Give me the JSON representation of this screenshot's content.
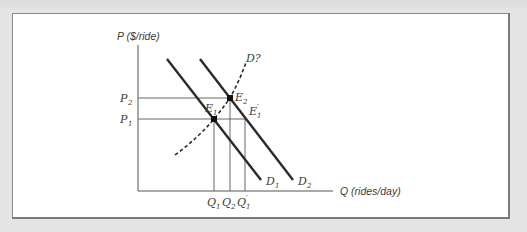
{
  "figure": {
    "y_axis_label": "P ($/ride)",
    "x_axis_label": "Q (rides/day)",
    "price_labels": {
      "p2": "P",
      "p2_sub": "2",
      "p1": "P",
      "p1_sub": "1"
    },
    "quantity_labels": {
      "q1": "Q",
      "q1_sub": "1",
      "q2": "Q",
      "q2_sub": "2",
      "q1p": "Q",
      "q1p_sub": "1",
      "q1p_prime": "′"
    },
    "curve_labels": {
      "d1": "D",
      "d1_sub": "1",
      "d2": "D",
      "d2_sub": "2",
      "d_question": "D?"
    },
    "point_labels": {
      "e1": "E",
      "e1_sub": "1",
      "e2": "E",
      "e2_sub": "2",
      "e1p": "E",
      "e1p_sub": "1",
      "e1p_prime": "′"
    },
    "colors": {
      "line": "#2b2b2b",
      "guide": "#555555",
      "text": "#3a3a3a",
      "frame_bg": "#ffffff",
      "page_bg": "#e4e4e4"
    }
  }
}
